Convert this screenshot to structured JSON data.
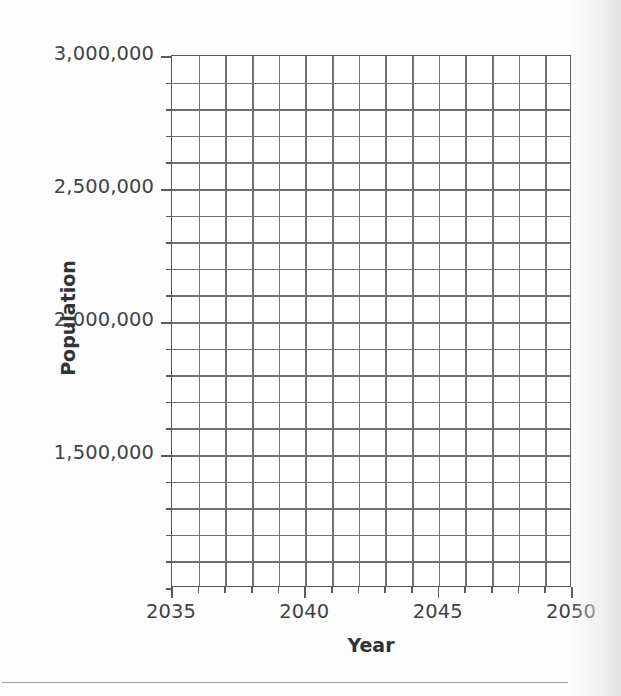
{
  "figure": {
    "background_color": "#fdfdfd",
    "plot_background_color": "#ffffff",
    "grid_color": "#6d7276",
    "axis_color": "#555a5e",
    "label_color": "#3f4447",
    "title_color": "#2f3436"
  },
  "axes": {
    "x_title": "Year",
    "y_title": "Population",
    "x_tick_labels": [
      "2035",
      "2040",
      "2045",
      "2050"
    ],
    "y_tick_labels": [
      "3,000,000",
      "2,500,000",
      "2,000,000",
      "1,500,000"
    ]
  },
  "chart_data": {
    "type": "line",
    "title": "",
    "subtitle": "",
    "xlabel": "Year",
    "ylabel": "Population",
    "x": [
      2035,
      2036,
      2037,
      2038,
      2039,
      2040,
      2041,
      2042,
      2043,
      2044,
      2045,
      2046,
      2047,
      2048,
      2049,
      2050
    ],
    "series": [],
    "xlim": [
      2035,
      2050
    ],
    "ylim": [
      1000000,
      3000000
    ],
    "x_major_ticks": [
      2035,
      2040,
      2045,
      2050
    ],
    "x_minor_ticks": [
      2036,
      2037,
      2038,
      2039,
      2041,
      2042,
      2043,
      2044,
      2046,
      2047,
      2048,
      2049
    ],
    "y_major_ticks": [
      3000000,
      2500000,
      2000000,
      1500000
    ],
    "y_major_tick_labels": [
      "3,000,000",
      "2,500,000",
      "2,000,000",
      "1,500,000"
    ],
    "y_minor_tick_interval": 100000,
    "x_minor_tick_interval": 1,
    "grid": true,
    "grid_style": "both-major-and-minor",
    "legend": null,
    "legend_position": "none",
    "annotations": []
  },
  "geometry": {
    "plot_left_px": 171,
    "plot_top_px": 55,
    "plot_width_px": 400,
    "plot_height_px": 532,
    "x_columns": 15,
    "y_rows_visible": 20
  }
}
